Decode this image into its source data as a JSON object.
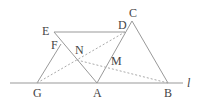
{
  "diagram": {
    "type": "geometry",
    "labels": {
      "E": "E",
      "D": "D",
      "C": "C",
      "F": "F",
      "N": "N",
      "M": "M",
      "G": "G",
      "A": "A",
      "B": "B",
      "line": "l"
    },
    "points": {
      "G": [
        37,
        83
      ],
      "A": [
        97,
        83
      ],
      "B": [
        168,
        83
      ],
      "C": [
        132,
        21
      ],
      "D": [
        125,
        32
      ],
      "E": [
        54,
        32
      ],
      "F": [
        61,
        44
      ],
      "N": [
        77,
        60
      ],
      "M": [
        107,
        66
      ]
    },
    "colors": {
      "stroke": "#999999",
      "text": "#444444"
    }
  }
}
